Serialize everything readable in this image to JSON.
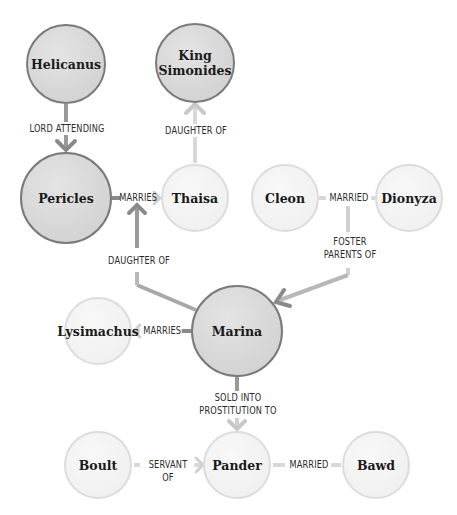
{
  "diagram": {
    "colors": {
      "primary_fill": "#d6d6d6",
      "primary_border": "#7a7a7a",
      "secondary_fill": "#f1f1f1",
      "secondary_border": "#dcdcdc",
      "edge_dark": "#8c8c8c",
      "edge_light": "#d4d4d4"
    },
    "nodes": [
      {
        "id": "helicanus",
        "label": "Helicanus",
        "kind": "primary"
      },
      {
        "id": "king_simonides",
        "label": "King\nSimonides",
        "kind": "primary"
      },
      {
        "id": "pericles",
        "label": "Pericles",
        "kind": "primary"
      },
      {
        "id": "thaisa",
        "label": "Thaisa",
        "kind": "secondary"
      },
      {
        "id": "cleon",
        "label": "Cleon",
        "kind": "secondary"
      },
      {
        "id": "dionyza",
        "label": "Dionyza",
        "kind": "secondary"
      },
      {
        "id": "lysimachus",
        "label": "Lysimachus",
        "kind": "secondary"
      },
      {
        "id": "marina",
        "label": "Marina",
        "kind": "primary"
      },
      {
        "id": "boult",
        "label": "Boult",
        "kind": "secondary"
      },
      {
        "id": "pander",
        "label": "Pander",
        "kind": "secondary"
      },
      {
        "id": "bawd",
        "label": "Bawd",
        "kind": "secondary"
      }
    ],
    "edges": [
      {
        "from": "Helicanus",
        "to": "Pericles",
        "label": "LORD ATTENDING"
      },
      {
        "from": "Thaisa",
        "to": "King Simonides",
        "label": "DAUGHTER OF"
      },
      {
        "from": "Pericles",
        "to": "Thaisa",
        "label": "MARRIES"
      },
      {
        "from": "Cleon",
        "to": "Dionyza",
        "label": "MARRIED"
      },
      {
        "from": "Marina",
        "to": "Pericles + Thaisa",
        "label": "DAUGHTER OF"
      },
      {
        "from": "Cleon + Dionyza",
        "to": "Marina",
        "label": "FOSTER\nPARENTS OF"
      },
      {
        "from": "Marina",
        "to": "Lysimachus",
        "label": "MARRIES"
      },
      {
        "from": "Marina",
        "to": "Pander",
        "label": "SOLD INTO\nPROSTITUTION TO"
      },
      {
        "from": "Boult",
        "to": "Pander",
        "label": "SERVANT OF"
      },
      {
        "from": "Pander",
        "to": "Bawd",
        "label": "MARRIED"
      }
    ]
  }
}
